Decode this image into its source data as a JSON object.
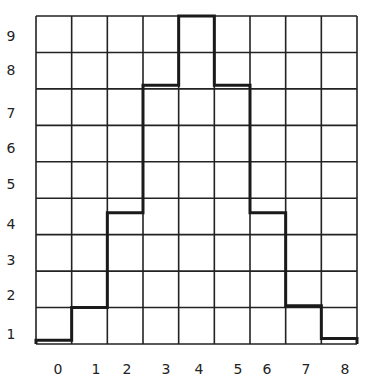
{
  "chart_data": {
    "type": "bar",
    "style": "step histogram on square grid",
    "title": "",
    "xlabel": "",
    "ylabel": "",
    "categories": [
      "0",
      "1",
      "2",
      "3",
      "4",
      "5",
      "6",
      "7",
      "8"
    ],
    "values": [
      0.1,
      1.0,
      3.6,
      7.1,
      9.0,
      7.1,
      3.6,
      1.05,
      0.15
    ],
    "x_tick_labels": [
      "0",
      "1",
      "2",
      "3",
      "4",
      "5",
      "6",
      "7",
      "8"
    ],
    "y_tick_labels": [
      "9",
      "8",
      "7",
      "6",
      "5",
      "4",
      "3",
      "2",
      "1"
    ],
    "ylim": [
      0,
      9
    ],
    "grid": true,
    "grid_columns": 9,
    "grid_rows": 9,
    "legend": null,
    "colors": {
      "line": "#1a1a1a",
      "grid": "#222222",
      "background": "#ffffff"
    }
  },
  "y_labels": [
    {
      "text": "9",
      "y": 29
    },
    {
      "text": "8",
      "y": 63
    },
    {
      "text": "7",
      "y": 106
    },
    {
      "text": "6",
      "y": 141
    },
    {
      "text": "5",
      "y": 177
    },
    {
      "text": "4",
      "y": 217
    },
    {
      "text": "3",
      "y": 253
    },
    {
      "text": "2",
      "y": 288
    },
    {
      "text": "1",
      "y": 327
    }
  ],
  "x_labels": [
    {
      "text": "0",
      "x": 51
    },
    {
      "text": "1",
      "x": 89
    },
    {
      "text": "2",
      "x": 120
    },
    {
      "text": "3",
      "x": 159
    },
    {
      "text": "4",
      "x": 192
    },
    {
      "text": "5",
      "x": 231
    },
    {
      "text": "6",
      "x": 260
    },
    {
      "text": "7",
      "x": 299
    },
    {
      "text": "8",
      "x": 338
    }
  ]
}
